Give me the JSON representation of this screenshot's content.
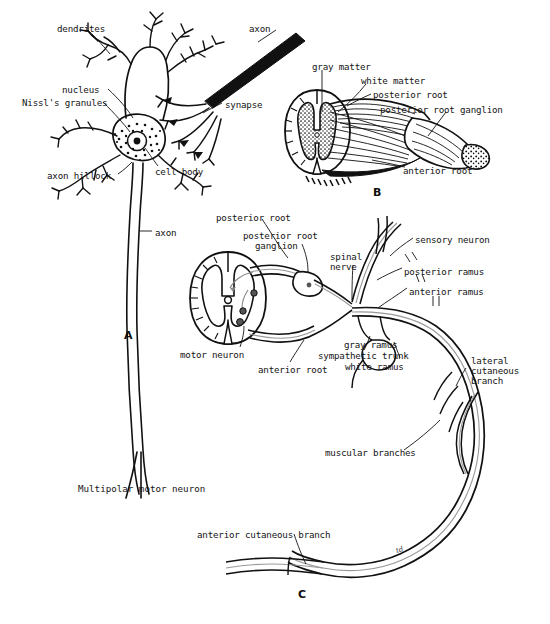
{
  "figure": {
    "background_color": "#ffffff",
    "ink_color": "#111111",
    "width": 550,
    "height": 624
  },
  "panels": [
    {
      "letter": "A",
      "caption": "Multipolar motor neuron",
      "labels": [
        {
          "text": "dendrites",
          "x": 57,
          "y": 24
        },
        {
          "text": "axon",
          "x": 249,
          "y": 24
        },
        {
          "text": "nucleus",
          "x": 62,
          "y": 85
        },
        {
          "text": "Nissl's granules",
          "x": 22,
          "y": 98
        },
        {
          "text": "synapse",
          "x": 225,
          "y": 100
        },
        {
          "text": "cell body",
          "x": 155,
          "y": 167
        },
        {
          "text": "axon hillock",
          "x": 47,
          "y": 171
        },
        {
          "text": "axon",
          "x": 155,
          "y": 228
        }
      ]
    },
    {
      "letter": "B",
      "caption": "",
      "labels": [
        {
          "text": "gray matter",
          "x": 312,
          "y": 62
        },
        {
          "text": "white matter",
          "x": 361,
          "y": 76
        },
        {
          "text": "posterior root",
          "x": 373,
          "y": 90
        },
        {
          "text": "posterior root ganglion",
          "x": 380,
          "y": 105
        },
        {
          "text": "anterior root",
          "x": 403,
          "y": 166
        }
      ]
    },
    {
      "letter": "C",
      "caption": "",
      "labels": [
        {
          "text": "posterior root",
          "x": 216,
          "y": 213
        },
        {
          "text": "posterior root",
          "x": 243,
          "y": 231
        },
        {
          "text": "ganglion",
          "x": 255,
          "y": 241
        },
        {
          "text": "spinal",
          "x": 330,
          "y": 252
        },
        {
          "text": "nerve",
          "x": 330,
          "y": 262
        },
        {
          "text": "sensory neuron",
          "x": 415,
          "y": 235
        },
        {
          "text": "posterior ramus",
          "x": 404,
          "y": 267
        },
        {
          "text": "anterior ramus",
          "x": 409,
          "y": 287
        },
        {
          "text": "gray ramus",
          "x": 344,
          "y": 340
        },
        {
          "text": "sympathetic trunk",
          "x": 318,
          "y": 351
        },
        {
          "text": "white ramus",
          "x": 345,
          "y": 362
        },
        {
          "text": "motor neuron",
          "x": 180,
          "y": 350
        },
        {
          "text": "anterior root",
          "x": 258,
          "y": 365
        },
        {
          "text": "lateral",
          "x": 471,
          "y": 356
        },
        {
          "text": "cutaneous",
          "x": 471,
          "y": 366
        },
        {
          "text": "branch",
          "x": 471,
          "y": 376
        },
        {
          "text": "muscular branches",
          "x": 325,
          "y": 448
        },
        {
          "text": "anterior cutaneous branch",
          "x": 197,
          "y": 530
        }
      ]
    }
  ],
  "panel_letters": [
    {
      "label": "A",
      "x": 124,
      "y": 329
    },
    {
      "label": "B",
      "x": 373,
      "y": 186
    },
    {
      "label": "C",
      "x": 298,
      "y": 588
    }
  ],
  "signature": {
    "text": "td",
    "x": 396,
    "y": 546
  }
}
